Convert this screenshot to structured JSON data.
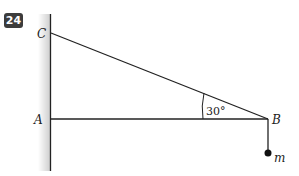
{
  "problem_number": "24",
  "points": {
    "C": "C",
    "A": "A",
    "B": "B"
  },
  "angle_label": "30°",
  "mass_label": "m",
  "colors": {
    "line": "#222222",
    "badge_bg": "#3c3c3c",
    "wall_shade": "#d8d8d8"
  }
}
